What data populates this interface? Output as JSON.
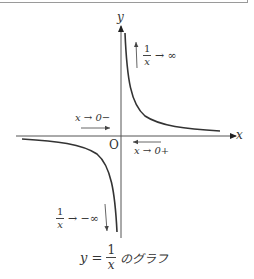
{
  "diagram": {
    "title_box": "",
    "axes": {
      "x_label": "x",
      "y_label": "y",
      "origin_label": "O"
    },
    "annotations": {
      "top_right": {
        "numerator": "1",
        "denominator": "x",
        "limit": "→ ∞"
      },
      "bottom_left": {
        "numerator": "1",
        "denominator": "x",
        "limit": "→ −∞"
      },
      "left_approach": "x → 0−",
      "right_approach": "x → 0+"
    },
    "caption": {
      "lhs": "y =",
      "numerator": "1",
      "denominator": "x",
      "suffix": "のグラフ"
    },
    "function": "y = 1/x",
    "colors": {
      "curve": "#333333",
      "axis": "#444444",
      "arrow": "#555555",
      "box_border": "#9a9a9a"
    }
  }
}
